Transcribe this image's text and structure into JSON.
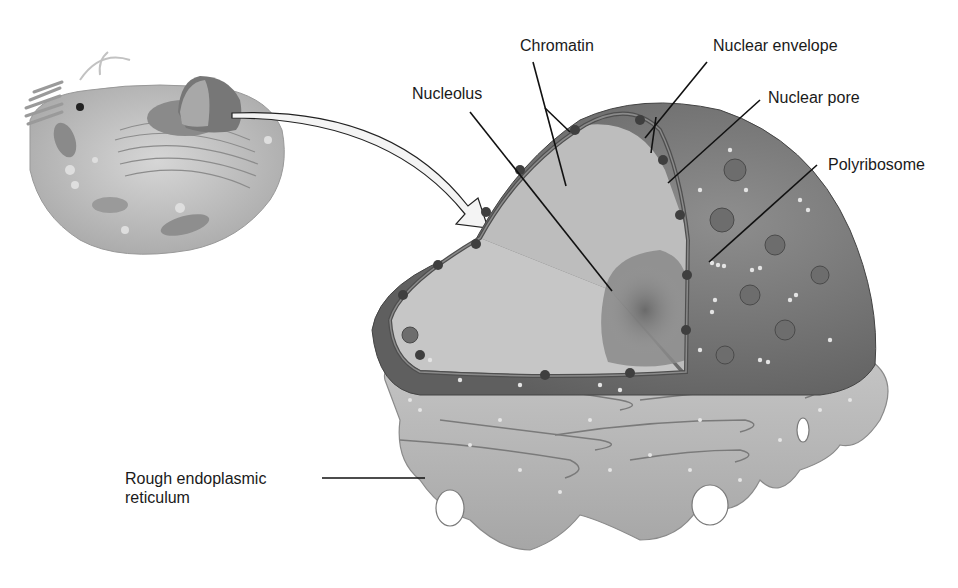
{
  "figure": {
    "inset": "Whole animal cell with nucleus highlighted",
    "arrow": "Curved arrow from cell nucleus to enlarged nucleus cutaway"
  },
  "labels": {
    "chromatin": "Chromatin",
    "nuclear_envelope": "Nuclear envelope",
    "nucleolus": "Nucleolus",
    "nuclear_pore": "Nuclear pore",
    "polyribosome": "Polyribosome",
    "rough_er_line1": "Rough endoplasmic",
    "rough_er_line2": "reticulum"
  },
  "colors": {
    "background": "#ffffff",
    "label_text": "#1a1a1a",
    "leader_line": "#111111",
    "nucleoplasm_light": "#c9c9c9",
    "nucleus_outer": "#7d7d7d",
    "envelope_dark": "#555555",
    "er_fill": "#b5b5b5",
    "ribosome_dot": "#e8e8e8",
    "cell_inset": "#b0b0b0"
  }
}
